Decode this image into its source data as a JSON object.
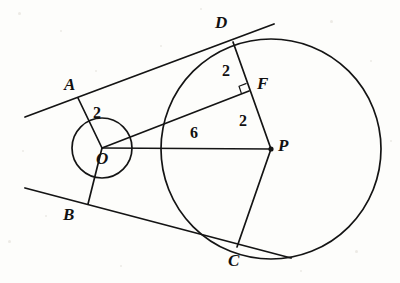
{
  "figure": {
    "background_color": "#fdfdfb",
    "stroke_color": "#141414",
    "width": 400,
    "height": 283
  },
  "circles": [
    {
      "name": "small-circle",
      "center_label": "O",
      "cx": 102,
      "cy": 148,
      "r": 30,
      "radius_value": "2"
    },
    {
      "name": "large-circle",
      "center_label": "P",
      "cx": 271,
      "cy": 149,
      "r": 110,
      "radius_value": "4"
    }
  ],
  "points": [
    {
      "id": "A",
      "label": "A",
      "x": 78,
      "y": 98,
      "label_x": 64,
      "label_y": 76,
      "dot": false
    },
    {
      "id": "B",
      "label": "B",
      "x": 88,
      "y": 204,
      "label_x": 63,
      "label_y": 206,
      "dot": false
    },
    {
      "id": "C",
      "label": "C",
      "x": 237,
      "y": 247,
      "label_x": 228,
      "label_y": 252,
      "dot": false
    },
    {
      "id": "D",
      "label": "D",
      "x": 233,
      "y": 42,
      "label_x": 215,
      "label_y": 14,
      "dot": false
    },
    {
      "id": "F",
      "label": "F",
      "x": 249,
      "y": 91,
      "label_x": 257,
      "label_y": 75,
      "dot": false
    },
    {
      "id": "O",
      "label": "O",
      "x": 102,
      "y": 148,
      "label_x": 96,
      "label_y": 150,
      "dot": false
    },
    {
      "id": "P",
      "label": "P",
      "x": 271,
      "y": 149,
      "label_x": 278,
      "label_y": 137,
      "dot": true
    }
  ],
  "segments": [
    {
      "name": "segment-OA",
      "from": "O",
      "to": "A",
      "x1": 102,
      "y1": 148,
      "x2": 78,
      "y2": 98
    },
    {
      "name": "segment-OB",
      "from": "O",
      "to": "B",
      "x1": 102,
      "y1": 148,
      "x2": 88,
      "y2": 204
    },
    {
      "name": "segment-OP",
      "from": "O",
      "to": "P",
      "x1": 102,
      "y1": 148,
      "x2": 271,
      "y2": 149
    },
    {
      "name": "segment-OF",
      "from": "O",
      "to": "F",
      "x1": 102,
      "y1": 148,
      "x2": 249,
      "y2": 91
    },
    {
      "name": "segment-DP",
      "from": "D",
      "to": "P",
      "x1": 233,
      "y1": 42,
      "x2": 271,
      "y2": 149
    },
    {
      "name": "segment-PC",
      "from": "P",
      "to": "C",
      "x1": 271,
      "y1": 149,
      "x2": 237,
      "y2": 247
    }
  ],
  "tangent_lines": [
    {
      "name": "upper-tangent-line",
      "x1": 25,
      "y1": 117,
      "x2": 274,
      "y2": 24
    },
    {
      "name": "lower-tangent-line",
      "x1": 25,
      "y1": 188,
      "x2": 291,
      "y2": 258
    }
  ],
  "length_labels": [
    {
      "name": "length-OA",
      "text": "2",
      "x": 93,
      "y": 105,
      "belongs_to": "OA"
    },
    {
      "name": "length-DF",
      "text": "2",
      "x": 222,
      "y": 63,
      "belongs_to": "DF"
    },
    {
      "name": "length-FP",
      "text": "2",
      "x": 239,
      "y": 113,
      "belongs_to": "FP"
    },
    {
      "name": "length-OP",
      "text": "6",
      "x": 190,
      "y": 125,
      "belongs_to": "OP"
    }
  ],
  "right_angle": {
    "name": "right-angle-at-F",
    "vertex_x": 249,
    "vertex_y": 91,
    "size": 8
  }
}
